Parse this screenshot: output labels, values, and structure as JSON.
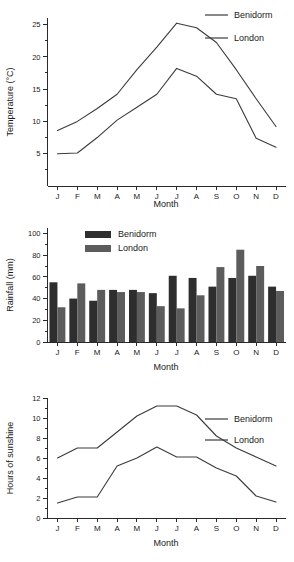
{
  "months": [
    "J",
    "F",
    "M",
    "A",
    "M",
    "J",
    "J",
    "A",
    "S",
    "O",
    "N",
    "D"
  ],
  "series_names": {
    "benidorm": "Benidorm",
    "london": "London"
  },
  "colors": {
    "benidorm_bar": "#2e2e2e",
    "london_bar": "#5c5c5c",
    "line": "#3b3b3b",
    "axis": "#2a2a2a"
  },
  "chart_data": [
    {
      "id": "temperature",
      "type": "line",
      "title": "",
      "xlabel": "Month",
      "ylabel": "Temperature (°C)",
      "categories": [
        "J",
        "F",
        "M",
        "A",
        "M",
        "J",
        "J",
        "A",
        "S",
        "O",
        "N",
        "D"
      ],
      "ylim": [
        0,
        26
      ],
      "yticks": [
        5,
        10,
        15,
        20,
        25
      ],
      "yticklabels": [
        "5",
        "10",
        "15",
        "20",
        "25"
      ],
      "minor_ticks": true,
      "grid": false,
      "legend_position": "top-right",
      "series": [
        {
          "name": "Benidorm",
          "values": [
            8.6,
            10.0,
            12.0,
            14.2,
            18.0,
            21.5,
            25.2,
            24.5,
            22.2,
            18.0,
            13.5,
            9.2
          ]
        },
        {
          "name": "London",
          "values": [
            5.0,
            5.1,
            7.5,
            10.2,
            12.2,
            14.2,
            18.2,
            17.0,
            14.2,
            13.5,
            7.4,
            6.0
          ]
        }
      ]
    },
    {
      "id": "rainfall",
      "type": "bar",
      "title": "",
      "xlabel": "Month",
      "ylabel": "Rainfall (mm)",
      "categories": [
        "J",
        "F",
        "M",
        "A",
        "M",
        "J",
        "J",
        "A",
        "S",
        "O",
        "N",
        "D"
      ],
      "ylim": [
        0,
        105
      ],
      "yticks": [
        0,
        20,
        40,
        60,
        80,
        100
      ],
      "yticklabels": [
        "0",
        "20",
        "40",
        "60",
        "80",
        "100"
      ],
      "minor_ticks": true,
      "grid": false,
      "legend_position": "inside-top-left",
      "series": [
        {
          "name": "Benidorm",
          "values": [
            55,
            40,
            38,
            48,
            48,
            45,
            61,
            59,
            51,
            59,
            61,
            51
          ]
        },
        {
          "name": "London",
          "values": [
            32,
            54,
            48,
            46,
            46,
            33,
            31,
            43,
            69,
            85,
            70,
            47
          ]
        }
      ]
    },
    {
      "id": "sunshine",
      "type": "line",
      "title": "",
      "xlabel": "Month",
      "ylabel": "Hours of sunshine",
      "categories": [
        "J",
        "F",
        "M",
        "A",
        "M",
        "J",
        "J",
        "A",
        "S",
        "O",
        "N",
        "D"
      ],
      "ylim": [
        0,
        12
      ],
      "yticks": [
        0,
        2,
        4,
        6,
        8,
        10,
        12
      ],
      "yticklabels": [
        "0",
        "2",
        "4",
        "6",
        "8",
        "10",
        "12"
      ],
      "minor_ticks": true,
      "grid": false,
      "legend_position": "middle-right",
      "series": [
        {
          "name": "Benidorm",
          "values": [
            6.0,
            7.0,
            7.0,
            8.6,
            10.2,
            11.2,
            11.2,
            10.3,
            8.2,
            7.0,
            6.1,
            5.2
          ]
        },
        {
          "name": "London",
          "values": [
            1.5,
            2.1,
            2.1,
            5.2,
            6.0,
            7.1,
            6.1,
            6.1,
            5.0,
            4.2,
            2.2,
            1.6
          ]
        }
      ]
    }
  ]
}
